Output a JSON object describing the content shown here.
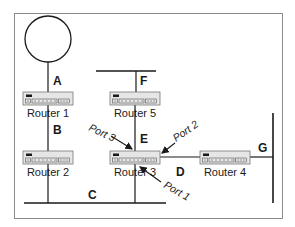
{
  "diagram": {
    "type": "network-topology",
    "colors": {
      "line": "#1a1a1a",
      "frame": "#8a8a8a",
      "router_fill": "#e6e6e6",
      "router_stroke": "#777777"
    },
    "routers": [
      {
        "id": "r1",
        "label": "Router 1"
      },
      {
        "id": "r2",
        "label": "Router 2"
      },
      {
        "id": "r3",
        "label": "Router 3"
      },
      {
        "id": "r4",
        "label": "Router 4"
      },
      {
        "id": "r5",
        "label": "Router 5"
      }
    ],
    "networks": [
      {
        "id": "A",
        "label": "A",
        "kind": "ring",
        "connects": [
          "ring",
          "Router 1"
        ]
      },
      {
        "id": "B",
        "label": "B",
        "kind": "link",
        "connects": [
          "Router 1",
          "Router 2"
        ]
      },
      {
        "id": "C",
        "label": "C",
        "kind": "bus",
        "connects": [
          "Router 2",
          "Router 3"
        ]
      },
      {
        "id": "D",
        "label": "D",
        "kind": "link",
        "connects": [
          "Router 3",
          "Router 4"
        ]
      },
      {
        "id": "E",
        "label": "E",
        "kind": "link",
        "connects": [
          "Router 5",
          "Router 3"
        ]
      },
      {
        "id": "F",
        "label": "F",
        "kind": "bus",
        "connects": [
          "Router 5"
        ]
      },
      {
        "id": "G",
        "label": "G",
        "kind": "bus",
        "connects": [
          "Router 4"
        ]
      }
    ],
    "ports": [
      {
        "label": "Port 1",
        "router": "Router 3",
        "network": "C"
      },
      {
        "label": "Port 2",
        "router": "Router 3",
        "network": "D"
      },
      {
        "label": "Port 3",
        "router": "Router 3",
        "network": "E"
      }
    ]
  }
}
